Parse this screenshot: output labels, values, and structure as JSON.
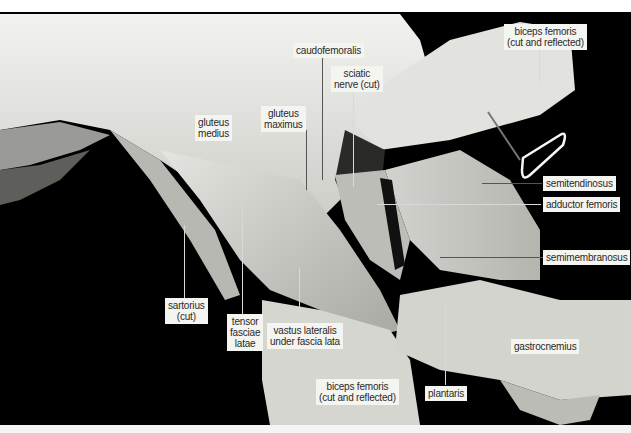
{
  "figure": {
    "labels": [
      {
        "id": "caudofemoralis",
        "text": "caudofemoralis"
      },
      {
        "id": "sciatic_nerve",
        "line1": "sciatic",
        "line2": "nerve (cut)"
      },
      {
        "id": "gluteus_medius",
        "line1": "gluteus",
        "line2": "medius"
      },
      {
        "id": "gluteus_maximus",
        "line1": "gluteus",
        "line2": "maximus"
      },
      {
        "id": "biceps_femoris_top",
        "line1": "biceps femoris",
        "line2": "(cut and reflected)"
      },
      {
        "id": "semitendinosus",
        "text": "semitendinosus"
      },
      {
        "id": "adductor_femoris",
        "text": "adductor femoris"
      },
      {
        "id": "semimembranosus",
        "text": "semimembranosus"
      },
      {
        "id": "sartorius",
        "line1": "sartorius",
        "line2": "(cut)"
      },
      {
        "id": "tensor_fasciae_latae",
        "line1": "tensor",
        "line2": "fasciae",
        "line3": "latae"
      },
      {
        "id": "vastus_lateralis",
        "line1": "vastus lateralis",
        "line2": "under fascia lata"
      },
      {
        "id": "gastrocnemius",
        "text": "gastrocnemius"
      },
      {
        "id": "biceps_femoris_bottom",
        "line1": "biceps femoris",
        "line2": "(cut and reflected)"
      },
      {
        "id": "plantaris",
        "text": "plantaris"
      }
    ]
  }
}
